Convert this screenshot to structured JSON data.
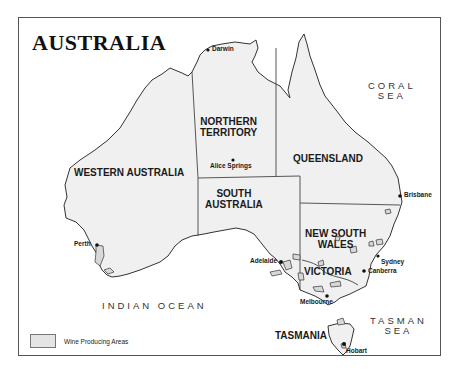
{
  "map": {
    "title": "AUSTRALIA",
    "colors": {
      "land": "#f0f0f0",
      "wine_area": "#d8d8d8",
      "border": "#333333",
      "frame": "#555555"
    },
    "states": [
      {
        "id": "wa",
        "line1": "WESTERN AUSTRALIA"
      },
      {
        "id": "nt",
        "line1": "NORTHERN",
        "line2": "TERRITORY"
      },
      {
        "id": "qld",
        "line1": "QUEENSLAND"
      },
      {
        "id": "sa",
        "line1": "SOUTH",
        "line2": "AUSTRALIA"
      },
      {
        "id": "nsw",
        "line1": "NEW SOUTH",
        "line2": "WALES"
      },
      {
        "id": "vic",
        "line1": "VICTORIA"
      },
      {
        "id": "tas",
        "line1": "TASMANIA"
      }
    ],
    "cities": [
      {
        "name": "Darwin"
      },
      {
        "name": "Alice Springs"
      },
      {
        "name": "Brisbane"
      },
      {
        "name": "Perth"
      },
      {
        "name": "Adelaide"
      },
      {
        "name": "Sydney"
      },
      {
        "name": "Canberra"
      },
      {
        "name": "Melbourne"
      },
      {
        "name": "Hobart"
      }
    ],
    "seas": [
      {
        "line1": "CORAL",
        "line2": "SEA"
      },
      {
        "line1": "INDIAN OCEAN"
      },
      {
        "line1": "TASMAN",
        "line2": "SEA"
      }
    ],
    "legend": {
      "label": "Wine Producing Areas"
    }
  }
}
